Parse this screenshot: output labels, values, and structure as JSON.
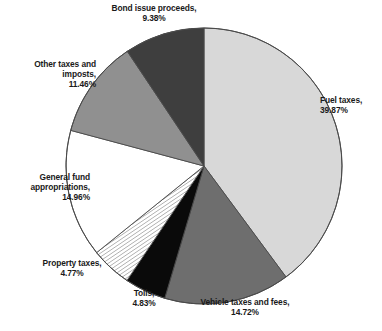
{
  "chart_data": {
    "type": "pie",
    "title": "",
    "subtitle": "",
    "xlabel": "",
    "ylabel": "",
    "legend_position": "none",
    "grid": false,
    "units": "percent",
    "start_angle_deg": 0,
    "direction": "clockwise",
    "categories": [
      "Fuel taxes",
      "Vehicle taxes and fees",
      "Tolls",
      "Property taxes",
      "General fund appropriations",
      "Other taxes and imposts",
      "Bond issue proceeds"
    ],
    "values": [
      39.87,
      14.72,
      4.83,
      4.77,
      14.96,
      11.46,
      9.38
    ],
    "slices": [
      {
        "label": "Fuel taxes",
        "value": 39.87,
        "value_text": "39.87%",
        "fill": "#d8d8d8",
        "pattern": "solid",
        "label_line1": "Fuel taxes,",
        "label_line2": "39.87%"
      },
      {
        "label": "Vehicle taxes and fees",
        "value": 14.72,
        "value_text": "14.72%",
        "fill": "#6e6e6e",
        "pattern": "solid",
        "label_line1": "Vehicle taxes and fees,",
        "label_line2": "14.72%"
      },
      {
        "label": "Tolls",
        "value": 4.83,
        "value_text": "4.83%",
        "fill": "#0a0a0a",
        "pattern": "solid",
        "label_line1": "Tolls,",
        "label_line2": "4.83%"
      },
      {
        "label": "Property taxes",
        "value": 4.77,
        "value_text": "4.77%",
        "fill": "#ffffff",
        "pattern": "diagonal-stripes",
        "label_line1": "Property taxes,",
        "label_line2": "4.77%"
      },
      {
        "label": "General fund appropriations",
        "value": 14.96,
        "value_text": "14.96%",
        "fill": "#ffffff",
        "pattern": "solid",
        "label_line1": "General fund",
        "label_line2": "appropriations,",
        "label_line3": "14.96%"
      },
      {
        "label": "Other taxes and imposts",
        "value": 11.46,
        "value_text": "11.46%",
        "fill": "#909090",
        "pattern": "solid",
        "label_line1": "Other taxes and",
        "label_line2": "imposts,",
        "label_line3": "11.46%"
      },
      {
        "label": "Bond issue proceeds",
        "value": 9.38,
        "value_text": "9.38%",
        "fill": "#3e3e3e",
        "pattern": "solid",
        "label_line1": "Bond issue proceeds,",
        "label_line2": "9.38%"
      }
    ]
  },
  "labels": {
    "bond": "Bond issue proceeds,\n9.38%",
    "other": "Other taxes and\nimposts,\n11.46%",
    "general": "General fund\nappropriations,\n14.96%",
    "property": "Property taxes,\n4.77%",
    "tolls": "Tolls,\n4.83%",
    "vehicle": "Vehicle taxes and fees,\n14.72%",
    "fuel": "Fuel taxes,\n39.87%"
  },
  "colors": {
    "outline": "#4a4a4a",
    "text": "#1a1a1a",
    "background": "#ffffff"
  },
  "geometry": {
    "center_x": 204,
    "center_y": 166,
    "radius": 138
  }
}
